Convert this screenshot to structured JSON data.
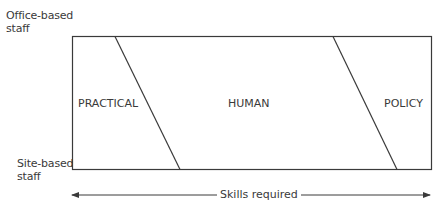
{
  "diagram": {
    "y_labels": {
      "top_line1": "Office-based",
      "top_line2": "staff",
      "bottom_line1": "Site-based",
      "bottom_line2": "staff"
    },
    "zones": [
      {
        "id": "practical",
        "label": "PRACTICAL"
      },
      {
        "id": "human",
        "label": "HUMAN"
      },
      {
        "id": "policy",
        "label": "POLICY"
      }
    ],
    "x_axis": {
      "label": "Skills required",
      "direction": "bidirectional"
    },
    "colors": {
      "line": "#3a3a3a",
      "text": "#3a3a3a",
      "background": "#ffffff"
    }
  }
}
